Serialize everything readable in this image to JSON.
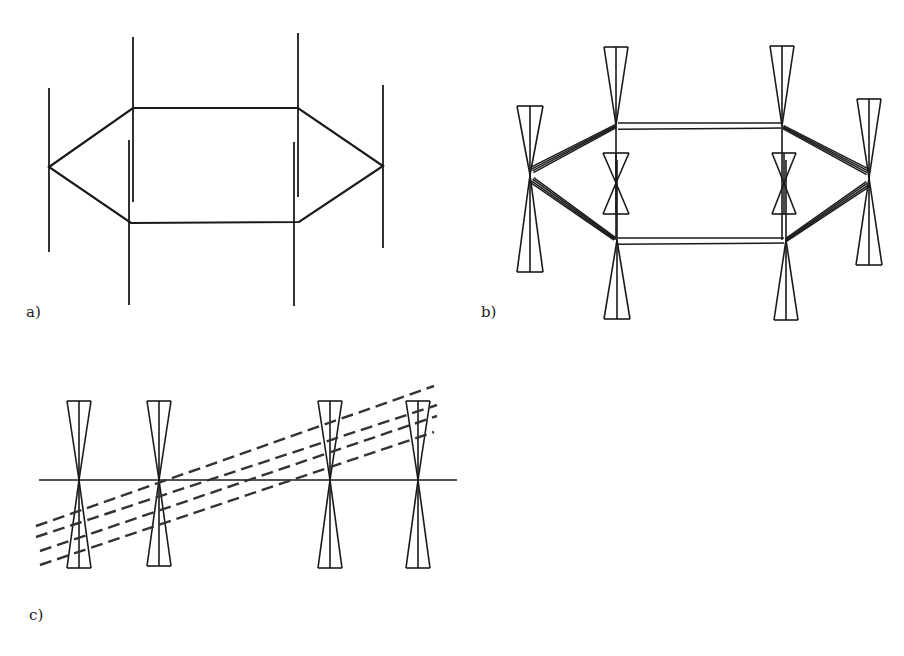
{
  "figure": {
    "stroke_color": "#1a1a1a",
    "background": "#ffffff",
    "panels": [
      {
        "id": "a",
        "label": "a)",
        "label_pos": [
          26,
          303
        ],
        "description": "Hexagonal ring of six nodes, each node drawn as a vertical line segment",
        "verticals": [
          {
            "x": 49,
            "y1": 88,
            "y2": 252
          },
          {
            "x": 133,
            "y1": 37,
            "y2": 202
          },
          {
            "x": 298,
            "y1": 33,
            "y2": 197
          },
          {
            "x": 383,
            "y1": 85,
            "y2": 248
          },
          {
            "x": 129,
            "y1": 140,
            "y2": 305
          },
          {
            "x": 294,
            "y1": 142,
            "y2": 306
          }
        ],
        "polygon": [
          [
            49,
            167
          ],
          [
            133,
            108
          ],
          [
            298,
            108
          ],
          [
            383,
            166
          ],
          [
            299,
            222
          ],
          [
            131,
            223
          ]
        ]
      },
      {
        "id": "b",
        "label": "b)",
        "label_pos": [
          481,
          303
        ],
        "description": "Same ring with each node drawn as an hourglass (bowtie) uncertainty shape; edges rendered as bundles of lines",
        "bowties": [
          {
            "cx": 530,
            "top": 106,
            "waist": 175,
            "bottom": 272,
            "wt": 13,
            "wb": 13
          },
          {
            "cx": 616,
            "top": 47,
            "waist": 125,
            "bottom": 240,
            "wt": 12,
            "wb": 0
          },
          {
            "cx": 616,
            "top": 153,
            "waist": 183,
            "bottom": 214,
            "wt": 13,
            "wb": 13
          },
          {
            "cx": 617,
            "top": 160,
            "waist": 240,
            "bottom": 319,
            "wt": 0,
            "wb": 13
          },
          {
            "cx": 782,
            "top": 46,
            "waist": 126,
            "bottom": 240,
            "wt": 12,
            "wb": 0
          },
          {
            "cx": 784,
            "top": 153,
            "waist": 183,
            "bottom": 214,
            "wt": 12,
            "wb": 12
          },
          {
            "cx": 786,
            "top": 160,
            "waist": 240,
            "bottom": 320,
            "wt": 0,
            "wb": 12
          },
          {
            "cx": 869,
            "top": 99,
            "waist": 178,
            "bottom": 265,
            "wt": 12,
            "wb": 13
          }
        ],
        "edge_bundles": [
          {
            "from": [
              618,
              123
            ],
            "to": [
              781,
              123
            ],
            "offsets": [
              0,
              5
            ]
          },
          {
            "from": [
              618,
              238
            ],
            "to": [
              784,
              238
            ],
            "offsets": [
              0,
              5
            ]
          },
          {
            "from": [
              616,
              126
            ],
            "to": [
              532,
              170
            ],
            "offsets": [
              -6,
              -2,
              2,
              6
            ]
          },
          {
            "from": [
              615,
              239
            ],
            "to": [
              532,
              180
            ],
            "offsets": [
              -6,
              -2,
              2,
              6
            ]
          },
          {
            "from": [
              783,
              127
            ],
            "to": [
              868,
              172
            ],
            "offsets": [
              -6,
              -2,
              2,
              6
            ]
          },
          {
            "from": [
              786,
              240
            ],
            "to": [
              868,
              184
            ],
            "offsets": [
              -6,
              -2,
              2,
              6
            ]
          }
        ]
      },
      {
        "id": "c",
        "label": "c)",
        "label_pos": [
          29,
          606
        ],
        "description": "Four hourglass nodes on a horizontal baseline with four dashed lines fanning through a common point",
        "baseline": {
          "x1": 39,
          "x2": 457,
          "y": 480
        },
        "bowties": [
          {
            "cx": 79,
            "top": 401,
            "waist": 480,
            "bottom": 568,
            "wt": 12,
            "wb": 12
          },
          {
            "cx": 159,
            "top": 401,
            "waist": 480,
            "bottom": 566,
            "wt": 12,
            "wb": 12
          },
          {
            "cx": 330,
            "top": 401,
            "waist": 480,
            "bottom": 568,
            "wt": 12,
            "wb": 12
          },
          {
            "cx": 418,
            "top": 401,
            "waist": 480,
            "bottom": 568,
            "wt": 12,
            "wb": 12
          }
        ],
        "dashed_lines": [
          {
            "x1": 36,
            "y1": 526,
            "x2": 434,
            "y2": 386
          },
          {
            "x1": 36,
            "y1": 537,
            "x2": 437,
            "y2": 405
          },
          {
            "x1": 40,
            "y1": 551,
            "x2": 437,
            "y2": 416
          },
          {
            "x1": 40,
            "y1": 565,
            "x2": 434,
            "y2": 432
          }
        ]
      }
    ]
  }
}
